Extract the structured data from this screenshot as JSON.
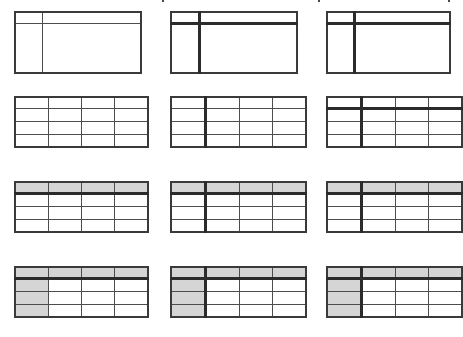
{
  "gallery": {
    "name": "Table Styles",
    "columns": 3,
    "rows": 4,
    "shade_color": "#d5d5d5",
    "rule_color": "#4d4d4d",
    "heavy_rule_color": "#2b2b2b",
    "background_color": "#ffffff",
    "top_clip_ticks": 3,
    "items": [
      {
        "id": "table-style-1-1",
        "label": "Table Grid, header split",
        "layout": "split",
        "header_cells": [
          "",
          ""
        ],
        "body_cells": [
          "",
          ""
        ],
        "shaded_header": false,
        "shaded_first_column": false,
        "heavy_vertical_divider": false,
        "heavy_header_rule": false
      },
      {
        "id": "table-style-1-2",
        "label": "Table Grid, header split, heavy divider",
        "layout": "split",
        "header_cells": [
          "",
          ""
        ],
        "body_cells": [
          "",
          ""
        ],
        "shaded_header": false,
        "shaded_first_column": false,
        "heavy_vertical_divider": true,
        "heavy_header_rule": true
      },
      {
        "id": "table-style-1-3",
        "label": "Table Grid, header split, heavy divider",
        "layout": "split",
        "header_cells": [
          "",
          ""
        ],
        "body_cells": [
          "",
          ""
        ],
        "shaded_header": false,
        "shaded_first_column": false,
        "heavy_vertical_divider": true,
        "heavy_header_rule": true
      },
      {
        "id": "table-style-2-1",
        "label": "Plain Table, all borders",
        "layout": "grid",
        "grid_rows": 4,
        "grid_cols": 4,
        "shaded_header": false,
        "shaded_first_column": false,
        "heavy_vertical_divider": false,
        "heavy_header_rule": false
      },
      {
        "id": "table-style-2-2",
        "label": "Plain Table, heavy first column divider",
        "layout": "grid",
        "grid_rows": 4,
        "grid_cols": 4,
        "shaded_header": false,
        "shaded_first_column": false,
        "heavy_vertical_divider": true,
        "heavy_header_rule": false
      },
      {
        "id": "table-style-2-3",
        "label": "Plain Table, heavy header rule and divider",
        "layout": "grid",
        "grid_rows": 4,
        "grid_cols": 4,
        "shaded_header": false,
        "shaded_first_column": false,
        "heavy_vertical_divider": true,
        "heavy_header_rule": true
      },
      {
        "id": "table-style-3-1",
        "label": "Shaded header row",
        "layout": "grid",
        "grid_rows": 4,
        "grid_cols": 4,
        "shaded_header": true,
        "shaded_first_column": false,
        "heavy_vertical_divider": false,
        "heavy_header_rule": true
      },
      {
        "id": "table-style-3-2",
        "label": "Shaded header row, heavy divider",
        "layout": "grid",
        "grid_rows": 4,
        "grid_cols": 4,
        "shaded_header": true,
        "shaded_first_column": false,
        "heavy_vertical_divider": true,
        "heavy_header_rule": true
      },
      {
        "id": "table-style-3-3",
        "label": "Shaded header row, heavy divider",
        "layout": "grid",
        "grid_rows": 4,
        "grid_cols": 4,
        "shaded_header": true,
        "shaded_first_column": false,
        "heavy_vertical_divider": true,
        "heavy_header_rule": true
      },
      {
        "id": "table-style-4-1",
        "label": "Shaded header row and first column",
        "layout": "grid",
        "grid_rows": 4,
        "grid_cols": 4,
        "shaded_header": true,
        "shaded_first_column": true,
        "heavy_vertical_divider": false,
        "heavy_header_rule": true
      },
      {
        "id": "table-style-4-2",
        "label": "Shaded header row and first column, heavy divider",
        "layout": "grid",
        "grid_rows": 4,
        "grid_cols": 4,
        "shaded_header": true,
        "shaded_first_column": true,
        "heavy_vertical_divider": true,
        "heavy_header_rule": true
      },
      {
        "id": "table-style-4-3",
        "label": "Shaded header row and first column, heavy divider",
        "layout": "grid",
        "grid_rows": 4,
        "grid_cols": 4,
        "shaded_header": true,
        "shaded_first_column": true,
        "heavy_vertical_divider": true,
        "heavy_header_rule": true
      }
    ]
  }
}
